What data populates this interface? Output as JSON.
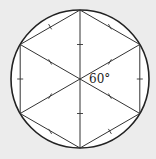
{
  "diagram": {
    "angle_label": "60°",
    "colors": {
      "background": "#ececec",
      "circle_fill": "#ffffff",
      "stroke": "#222222"
    },
    "center": [
      80,
      79
    ],
    "radius": 69,
    "shapes": [
      "circle",
      "hexagon",
      "three diagonals through center"
    ],
    "tick_marks": "single tick at midpoint of each hexagon side and each half-diagonal"
  }
}
